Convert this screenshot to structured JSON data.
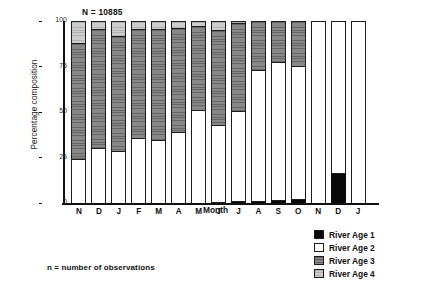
{
  "chart_data": {
    "type": "bar",
    "subtype": "stacked-percentage",
    "title": "",
    "xlabel": "Month",
    "ylabel": "Percentage composition",
    "ylim": [
      0,
      100
    ],
    "yticks": [
      "0",
      "25",
      "50",
      "75",
      "100"
    ],
    "grid": false,
    "legend_position": "bottom-right",
    "annotation": "N = 10885",
    "footnote": "n = number of observations",
    "categories": [
      "N",
      "D",
      "J",
      "F",
      "M",
      "A",
      "M",
      "J",
      "J",
      "A",
      "S",
      "O",
      "N",
      "D",
      "J"
    ],
    "series": [
      {
        "name": "River Age 1",
        "color": "#090909",
        "values": [
          0,
          0,
          0,
          0,
          0,
          0,
          0,
          0.7,
          1.2,
          1.0,
          1.6,
          2.2,
          0,
          16.5,
          0
        ]
      },
      {
        "name": "River Age 2",
        "color": "#ffffff",
        "values": [
          24.0,
          30.0,
          28.5,
          35.5,
          34.5,
          39.0,
          51.0,
          42.3,
          49.5,
          72.0,
          76.0,
          73.0,
          100.0,
          83.5,
          100.0
        ]
      },
      {
        "name": "River Age 3",
        "color": "#7b7b7b",
        "values": [
          64.0,
          65.5,
          63.5,
          60.0,
          61.0,
          57.0,
          46.0,
          52.0,
          48.3,
          27.0,
          22.4,
          24.8,
          0,
          0,
          0
        ]
      },
      {
        "name": "River Age 4",
        "color": "#bfbfbf",
        "values": [
          12.0,
          4.5,
          8.0,
          4.5,
          4.5,
          4.0,
          3.0,
          5.0,
          1.0,
          0,
          0,
          0,
          0,
          0,
          0
        ]
      }
    ]
  },
  "legend": {
    "items": [
      {
        "label": "River Age 1",
        "key": "age1"
      },
      {
        "label": "River Age 2",
        "key": "age2"
      },
      {
        "label": "River Age 3",
        "key": "age3"
      },
      {
        "label": "River Age 4",
        "key": "age4"
      }
    ]
  }
}
